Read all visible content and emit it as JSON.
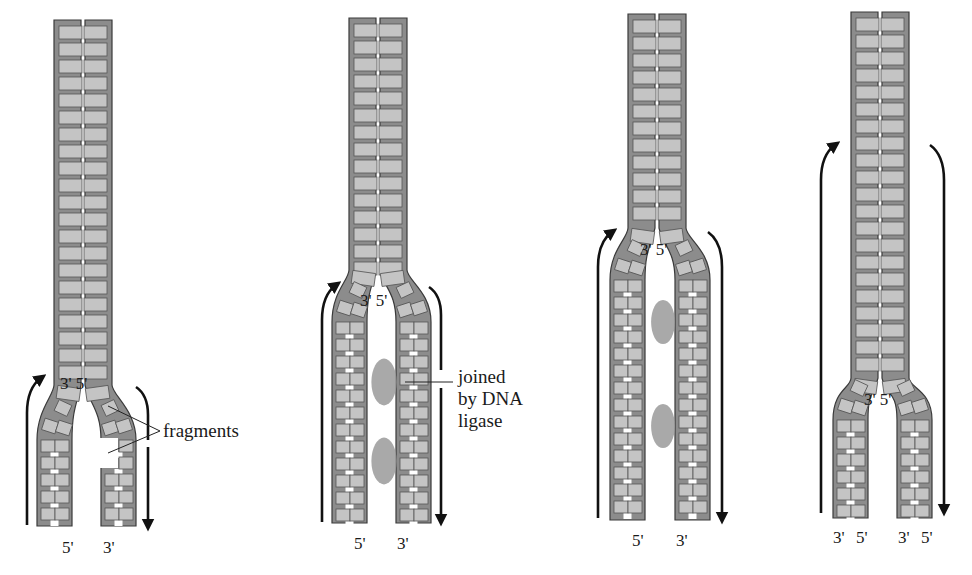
{
  "figure": {
    "colors": {
      "backbone": "#8c8c8c",
      "backbone_outline": "#3a3a3a",
      "base": "#c4c4c4",
      "base_outline": "#555555",
      "ligase_blob": "#9a9a9a",
      "arrow": "#111111",
      "background": "#ffffff"
    }
  },
  "panels": [
    {
      "id": "stage-1",
      "stem": {
        "cx": 83,
        "top": 20,
        "width": 58,
        "fork_y": 385
      },
      "legs": {
        "left_x": 37,
        "right_x": 101,
        "width": 35,
        "bottom": 526,
        "start_y": 440
      },
      "fork_labels": {
        "left": "3'",
        "right": "5'",
        "x": 60,
        "y": 374
      },
      "end_labels": [
        {
          "text": "5'",
          "x": 62,
          "y": 538
        },
        {
          "text": "3'",
          "x": 103,
          "y": 538
        }
      ],
      "arrows": [
        {
          "dir": "up",
          "x": 27,
          "y1": 525,
          "y2": 388,
          "curve": "in"
        },
        {
          "dir": "down-top",
          "x": 148,
          "y1": 395,
          "y2": 440,
          "curve": "in"
        },
        {
          "dir": "down",
          "x": 148,
          "y1": 447,
          "y2": 525,
          "curve": "none"
        }
      ],
      "gaps": [
        {
          "y": 438,
          "h": 30
        }
      ],
      "ligase": [],
      "callout": {
        "lines": [
          "fragments"
        ],
        "x": 163,
        "y": 420,
        "pointers": [
          [
            108,
            406
          ],
          [
            108,
            453
          ]
        ],
        "anchor": [
          160,
          431
        ]
      }
    },
    {
      "id": "stage-2",
      "stem": {
        "cx": 378,
        "top": 18,
        "width": 58,
        "fork_y": 270
      },
      "legs": {
        "left_x": 332,
        "right_x": 396,
        "width": 35,
        "bottom": 523,
        "start_y": 322
      },
      "fork_labels": {
        "left": "3'",
        "right": "5'",
        "x": 360,
        "y": 291
      },
      "end_labels": [
        {
          "text": "5'",
          "x": 354,
          "y": 534
        },
        {
          "text": "3'",
          "x": 397,
          "y": 534
        }
      ],
      "arrows": [
        {
          "dir": "up",
          "x": 322,
          "y1": 522,
          "y2": 295,
          "curve": "in"
        },
        {
          "dir": "down-top",
          "x": 441,
          "y1": 295,
          "y2": 370,
          "curve": "in"
        },
        {
          "dir": "down",
          "x": 441,
          "y1": 388,
          "y2": 520,
          "curve": "none"
        }
      ],
      "gaps": [],
      "ligase": [
        {
          "cx": 392,
          "cy": 382,
          "r": 18
        },
        {
          "cx": 392,
          "cy": 461,
          "r": 18
        }
      ],
      "callout": {
        "lines": [
          "joined",
          "by DNA",
          "ligase"
        ],
        "x": 458,
        "y": 366,
        "pointers": [
          [
            405,
            382
          ]
        ],
        "anchor": [
          453,
          382
        ]
      }
    },
    {
      "id": "stage-3",
      "stem": {
        "cx": 657,
        "top": 14,
        "width": 58,
        "fork_y": 228
      },
      "legs": {
        "left_x": 610,
        "right_x": 675,
        "width": 35,
        "bottom": 520,
        "start_y": 280
      },
      "fork_labels": {
        "left": "3'",
        "right": "5'",
        "x": 640,
        "y": 240
      },
      "end_labels": [
        {
          "text": "5'",
          "x": 632,
          "y": 531
        },
        {
          "text": "3'",
          "x": 676,
          "y": 531
        }
      ],
      "arrows": [
        {
          "dir": "up",
          "x": 598,
          "y1": 518,
          "y2": 242,
          "curve": "in"
        },
        {
          "dir": "down",
          "x": 722,
          "y1": 242,
          "y2": 518,
          "curve": "in"
        }
      ],
      "gaps": [],
      "ligase": [
        {
          "cx": 671,
          "cy": 322,
          "r": 17
        },
        {
          "cx": 671,
          "cy": 426,
          "r": 17
        }
      ],
      "callout": null
    },
    {
      "id": "stage-4",
      "stem": {
        "cx": 880,
        "top": 12,
        "width": 58,
        "fork_y": 378
      },
      "legs": {
        "left_x": 833,
        "right_x": 897,
        "width": 35,
        "bottom": 518,
        "start_y": 420
      },
      "fork_labels": {
        "left": "3'",
        "right": "5'",
        "x": 864,
        "y": 390
      },
      "end_labels": [
        {
          "text": "3'",
          "x": 833,
          "y": 528
        },
        {
          "text": "5'",
          "x": 856,
          "y": 528
        },
        {
          "text": "3'",
          "x": 898,
          "y": 528
        },
        {
          "text": "5'",
          "x": 921,
          "y": 528
        }
      ],
      "arrows": [
        {
          "dir": "up",
          "x": 821,
          "y1": 513,
          "y2": 155,
          "curve": "in"
        },
        {
          "dir": "down",
          "x": 944,
          "y1": 155,
          "y2": 510,
          "curve": "in"
        }
      ],
      "gaps": [],
      "ligase": [],
      "callout": null
    }
  ]
}
